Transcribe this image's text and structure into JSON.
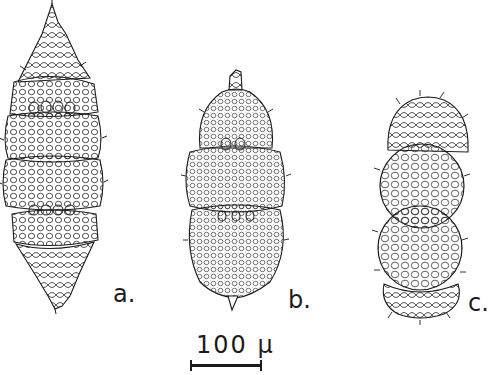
{
  "figure": {
    "specimens": [
      {
        "id": "a",
        "label": "a.",
        "shape": "spindle, multi-segmented, spiny apex and tip"
      },
      {
        "id": "b",
        "label": "b.",
        "shape": "ovoid, three-chambered, short apical horn"
      },
      {
        "id": "c",
        "label": "c.",
        "shape": "double sphere with spiny polar caps"
      }
    ],
    "scale_bar": {
      "label": "100 µ",
      "length_px": 72
    },
    "colors": {
      "ink": "#1c1c1c",
      "paper": "#ffffff"
    }
  }
}
